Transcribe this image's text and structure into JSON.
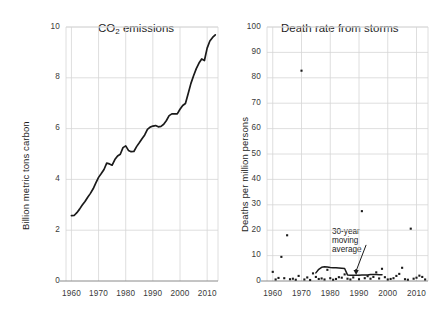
{
  "figure": {
    "background": "#ffffff",
    "line_color": "#1a1a1a",
    "grid_color": "#d6d6d6",
    "axis_color": "#8a8a8a",
    "text_color": "#1d1d1d"
  },
  "chart_data": [
    {
      "type": "line",
      "title": "CO2 emissions",
      "title_display": "CO",
      "title_sub": "2",
      "title_rest": " emissions",
      "xlabel": "",
      "ylabel": "Billion metric tons carbon",
      "xlim": [
        1958,
        2014
      ],
      "ylim": [
        0,
        10
      ],
      "xticks": [
        "1960",
        "1970",
        "1980",
        "1990",
        "2000",
        "2010"
      ],
      "xtick_values": [
        1960,
        1970,
        1980,
        1990,
        2000,
        2010
      ],
      "yticks": [
        "0",
        "2",
        "4",
        "6",
        "8",
        "10"
      ],
      "ytick_values": [
        0,
        2,
        4,
        6,
        8,
        10
      ],
      "grid": true,
      "legend": null,
      "x": [
        1960,
        1961,
        1962,
        1963,
        1964,
        1965,
        1966,
        1967,
        1968,
        1969,
        1970,
        1971,
        1972,
        1973,
        1974,
        1975,
        1976,
        1977,
        1978,
        1979,
        1980,
        1981,
        1982,
        1983,
        1984,
        1985,
        1986,
        1987,
        1988,
        1989,
        1990,
        1991,
        1992,
        1993,
        1994,
        1995,
        1996,
        1997,
        1998,
        1999,
        2000,
        2001,
        2002,
        2003,
        2004,
        2005,
        2006,
        2007,
        2008,
        2009,
        2010,
        2011,
        2012,
        2013
      ],
      "y": [
        2.57,
        2.58,
        2.69,
        2.83,
        2.99,
        3.13,
        3.3,
        3.45,
        3.63,
        3.86,
        4.08,
        4.23,
        4.39,
        4.64,
        4.61,
        4.56,
        4.78,
        4.92,
        4.99,
        5.25,
        5.32,
        5.14,
        5.09,
        5.1,
        5.29,
        5.44,
        5.6,
        5.75,
        5.97,
        6.06,
        6.1,
        6.12,
        6.07,
        6.09,
        6.17,
        6.32,
        6.51,
        6.58,
        6.58,
        6.58,
        6.76,
        6.91,
        6.99,
        7.37,
        7.77,
        8.08,
        8.36,
        8.58,
        8.74,
        8.68,
        9.17,
        9.45,
        9.59,
        9.69
      ]
    },
    {
      "type": "scatter",
      "title": "Death rate from storms",
      "xlabel": "",
      "ylabel": "Deaths per million persons",
      "xlim": [
        1958,
        2014
      ],
      "ylim": [
        0,
        100
      ],
      "xticks": [
        "1960",
        "1970",
        "1980",
        "1990",
        "2000",
        "2010"
      ],
      "xtick_values": [
        1960,
        1970,
        1980,
        1990,
        2000,
        2010
      ],
      "yticks": [
        "0",
        "10",
        "20",
        "30",
        "40",
        "50",
        "60",
        "70",
        "80",
        "90",
        "100"
      ],
      "ytick_values": [
        0,
        10,
        20,
        30,
        40,
        50,
        60,
        70,
        80,
        90,
        100
      ],
      "grid": true,
      "annotation": {
        "lines": [
          "30-year",
          "moving",
          "average"
        ],
        "text": "30-year moving average",
        "target_x": 1989,
        "target_y": 2.4
      },
      "series": [
        {
          "name": "annual death rate",
          "type": "scatter",
          "x": [
            1960,
            1961,
            1962,
            1963,
            1964,
            1965,
            1966,
            1967,
            1968,
            1969,
            1970,
            1971,
            1972,
            1973,
            1974,
            1975,
            1976,
            1977,
            1978,
            1979,
            1980,
            1981,
            1982,
            1983,
            1984,
            1985,
            1986,
            1987,
            1988,
            1989,
            1990,
            1991,
            1992,
            1993,
            1994,
            1995,
            1996,
            1997,
            1998,
            1999,
            2000,
            2001,
            2002,
            2003,
            2004,
            2005,
            2006,
            2007,
            2008,
            2009,
            2010,
            2011,
            2012,
            2013
          ],
          "y": [
            3.6,
            0.6,
            1.2,
            9.5,
            1.1,
            18.0,
            0.7,
            0.9,
            0.5,
            2.0,
            82.8,
            0.6,
            1.4,
            0.4,
            3.0,
            1.6,
            0.8,
            1.0,
            0.6,
            4.4,
            1.1,
            0.5,
            0.8,
            1.5,
            1.3,
            2.6,
            0.9,
            0.6,
            1.4,
            4.2,
            0.7,
            27.5,
            1.1,
            1.9,
            0.9,
            1.6,
            3.4,
            1.0,
            4.8,
            1.5,
            0.6,
            0.8,
            1.1,
            2.0,
            2.8,
            5.2,
            0.7,
            0.5,
            20.6,
            0.9,
            1.3,
            2.1,
            1.6,
            0.6
          ]
        },
        {
          "name": "30-year moving average",
          "type": "line",
          "x": [
            1975,
            1976,
            1977,
            1978,
            1979,
            1980,
            1981,
            1982,
            1983,
            1984,
            1985,
            1986,
            1987,
            1988,
            1989,
            1990,
            1991,
            1992,
            1993,
            1994,
            1995,
            1996,
            1997,
            1998
          ],
          "y": [
            3.2,
            4.6,
            5.4,
            5.6,
            5.5,
            5.3,
            5.2,
            5.2,
            5.1,
            5.0,
            4.9,
            2.4,
            2.3,
            2.3,
            2.3,
            2.3,
            2.4,
            2.4,
            2.4,
            2.6,
            2.6,
            2.6,
            2.5,
            2.5
          ]
        }
      ]
    }
  ]
}
